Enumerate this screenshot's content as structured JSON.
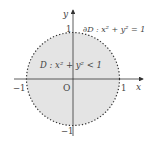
{
  "diagram": {
    "axes": {
      "x_label": "x",
      "y_label": "y",
      "origin_label": "O",
      "ticks": {
        "x_neg": "−1",
        "x_pos": "1",
        "y_pos": "1",
        "y_neg": "−1"
      }
    },
    "region": {
      "label": "D : x² + y² < 1",
      "fill": "#e4e4e4"
    },
    "boundary": {
      "label": "∂D : x² + y² = 1",
      "stroke": "#333333",
      "style": "dotted"
    },
    "colors": {
      "axis": "#333333",
      "text": "#444444",
      "background": "#ffffff"
    }
  }
}
